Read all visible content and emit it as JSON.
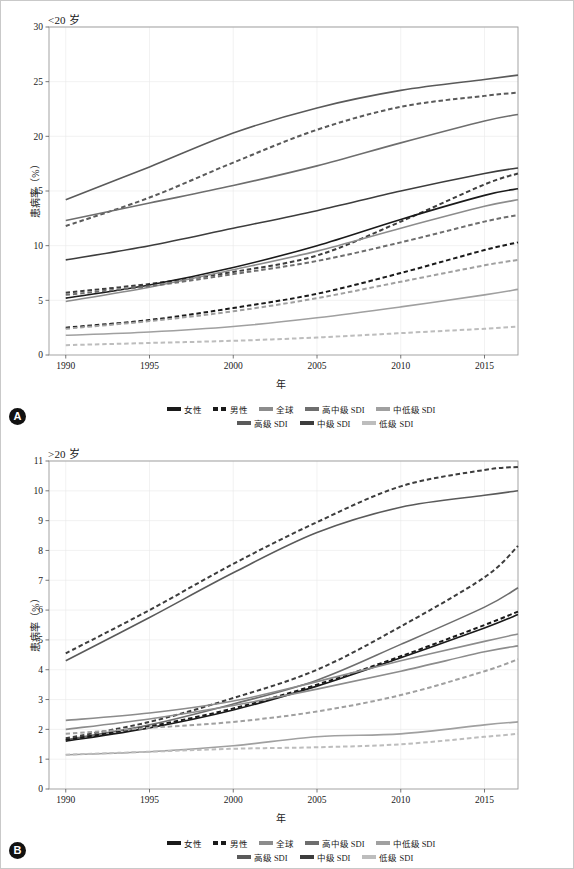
{
  "figure": {
    "background": "#ffffff",
    "border_color": "#c9c9c9"
  },
  "panels": [
    {
      "badge": "A",
      "title": "<20 岁",
      "xlabel": "年",
      "ylabel": "患病率（%）"
    },
    {
      "badge": "B",
      "title": ">20 岁",
      "xlabel": "年",
      "ylabel": "患病率（%）"
    }
  ],
  "legend": {
    "rows": [
      [
        {
          "label": "女性",
          "color": "#1a1a1a",
          "dash": "solid",
          "key": "female"
        },
        {
          "label": "男性",
          "color": "#1a1a1a",
          "dash": "dashed",
          "key": "male"
        },
        {
          "label": "全球",
          "color": "#8c8c8c",
          "dash": "solid",
          "key": "global"
        },
        {
          "label": "高中级 SDI",
          "color": "#6e6e6e",
          "dash": "solid",
          "key": "high-middle-sdi"
        },
        {
          "label": "中低级 SDI",
          "color": "#a0a0a0",
          "dash": "solid",
          "key": "low-middle-sdi"
        }
      ],
      [
        {
          "label": "高级 SDI",
          "color": "#5a5a5a",
          "dash": "solid",
          "key": "high-sdi"
        },
        {
          "label": "中级 SDI",
          "color": "#3d3d3d",
          "dash": "solid",
          "key": "middle-sdi"
        },
        {
          "label": "低级 SDI",
          "color": "#bdbdbd",
          "dash": "solid",
          "key": "low-sdi"
        }
      ]
    ]
  },
  "chart_data": [
    {
      "type": "line",
      "title": "<20 岁",
      "xlabel": "年",
      "ylabel": "患病率（%）",
      "xlim": [
        1989,
        2017
      ],
      "ylim": [
        0,
        30
      ],
      "xticks": [
        1990,
        1995,
        2000,
        2005,
        2010,
        2015
      ],
      "yticks": [
        0,
        5,
        10,
        15,
        20,
        25,
        30
      ],
      "grid": true,
      "legend_position": "below",
      "x": [
        1990,
        1995,
        2000,
        2005,
        2010,
        2015,
        2017
      ],
      "series": [
        {
          "name": "高级 SDI",
          "sex": "女性",
          "dash": "solid",
          "color": "#5a5a5a",
          "values": [
            14.2,
            17.2,
            20.3,
            22.6,
            24.2,
            25.2,
            25.6
          ]
        },
        {
          "name": "高级 SDI",
          "sex": "男性",
          "dash": "dashed",
          "color": "#5a5a5a",
          "values": [
            11.8,
            14.4,
            17.6,
            20.6,
            22.7,
            23.7,
            24.0
          ]
        },
        {
          "name": "高中级 SDI",
          "sex": "女性",
          "dash": "solid",
          "color": "#6e6e6e",
          "values": [
            12.3,
            13.9,
            15.5,
            17.3,
            19.4,
            21.4,
            22.0
          ]
        },
        {
          "name": "中级 SDI",
          "sex": "女性",
          "dash": "solid",
          "color": "#3d3d3d",
          "values": [
            8.7,
            10.0,
            11.6,
            13.2,
            15.0,
            16.6,
            17.1
          ]
        },
        {
          "name": "中级 SDI",
          "sex": "男性",
          "dash": "dashed",
          "color": "#3d3d3d",
          "values": [
            5.7,
            6.5,
            7.6,
            9.1,
            12.2,
            15.6,
            16.6
          ]
        },
        {
          "name": "女性",
          "sex": "女性",
          "dash": "solid",
          "color": "#1a1a1a",
          "values": [
            5.2,
            6.4,
            8.0,
            10.0,
            12.4,
            14.6,
            15.2
          ]
        },
        {
          "name": "全球",
          "sex": "女性",
          "dash": "solid",
          "color": "#8c8c8c",
          "values": [
            4.9,
            6.2,
            7.8,
            9.5,
            11.6,
            13.6,
            14.2
          ]
        },
        {
          "name": "高中级 SDI",
          "sex": "男性",
          "dash": "dashed",
          "color": "#6e6e6e",
          "values": [
            5.5,
            6.3,
            7.4,
            8.6,
            10.3,
            12.2,
            12.8
          ]
        },
        {
          "name": "男性",
          "sex": "男性",
          "dash": "dashed",
          "color": "#1a1a1a",
          "values": [
            2.5,
            3.2,
            4.3,
            5.6,
            7.5,
            9.6,
            10.3
          ]
        },
        {
          "name": "中低级 SDI",
          "sex": "男性",
          "dash": "dashed",
          "color": "#a0a0a0",
          "values": [
            2.4,
            3.1,
            4.0,
            5.2,
            6.7,
            8.2,
            8.7
          ]
        },
        {
          "name": "中低级 SDI",
          "sex": "女性",
          "dash": "solid",
          "color": "#a0a0a0",
          "values": [
            1.8,
            2.1,
            2.6,
            3.4,
            4.4,
            5.5,
            6.0
          ]
        },
        {
          "name": "低级 SDI",
          "sex": "男性",
          "dash": "dashed",
          "color": "#bdbdbd",
          "values": [
            0.9,
            1.1,
            1.3,
            1.6,
            2.0,
            2.4,
            2.6
          ]
        }
      ]
    },
    {
      "type": "line",
      "title": ">20 岁",
      "xlabel": "年",
      "ylabel": "患病率（%）",
      "xlim": [
        1989,
        2017
      ],
      "ylim": [
        0,
        11
      ],
      "xticks": [
        1990,
        1995,
        2000,
        2005,
        2010,
        2015
      ],
      "yticks": [
        0,
        1,
        2,
        3,
        4,
        5,
        6,
        7,
        8,
        9,
        10,
        11
      ],
      "grid": true,
      "legend_position": "below",
      "x": [
        1990,
        1995,
        2000,
        2005,
        2010,
        2015,
        2017
      ],
      "series": [
        {
          "name": "高级 SDI",
          "sex": "男性",
          "dash": "dashed",
          "color": "#3d3d3d",
          "values": [
            4.55,
            6.0,
            7.55,
            8.95,
            10.15,
            10.7,
            10.8
          ]
        },
        {
          "name": "高级 SDI",
          "sex": "女性",
          "dash": "solid",
          "color": "#5a5a5a",
          "values": [
            4.3,
            5.75,
            7.25,
            8.6,
            9.45,
            9.85,
            10.0
          ]
        },
        {
          "name": "中级 SDI",
          "sex": "男性",
          "dash": "dashed",
          "color": "#3d3d3d",
          "values": [
            1.7,
            2.25,
            3.05,
            4.0,
            5.45,
            7.1,
            8.15
          ]
        },
        {
          "name": "中级 SDI",
          "sex": "女性",
          "dash": "solid",
          "color": "#6e6e6e",
          "values": [
            1.65,
            2.15,
            2.85,
            3.65,
            4.85,
            6.1,
            6.75
          ]
        },
        {
          "name": "女性",
          "sex": "女性",
          "dash": "solid",
          "color": "#1a1a1a",
          "values": [
            1.6,
            2.05,
            2.65,
            3.45,
            4.4,
            5.4,
            5.85
          ]
        },
        {
          "name": "男性",
          "sex": "男性",
          "dash": "dashed",
          "color": "#1a1a1a",
          "values": [
            1.65,
            2.1,
            2.7,
            3.5,
            4.45,
            5.5,
            5.95
          ]
        },
        {
          "name": "高中级 SDI",
          "sex": "女性",
          "dash": "solid",
          "color": "#8c8c8c",
          "values": [
            2.3,
            2.55,
            2.95,
            3.6,
            4.3,
            4.95,
            5.2
          ]
        },
        {
          "name": "全球",
          "sex": "女性",
          "dash": "solid",
          "color": "#8c8c8c",
          "values": [
            2.0,
            2.35,
            2.8,
            3.35,
            3.95,
            4.6,
            4.8
          ]
        },
        {
          "name": "中低级 SDI",
          "sex": "男性",
          "dash": "dashed",
          "color": "#a0a0a0",
          "values": [
            1.85,
            2.05,
            2.25,
            2.6,
            3.15,
            3.95,
            4.35
          ]
        },
        {
          "name": "中低级 SDI",
          "sex": "女性",
          "dash": "solid",
          "color": "#a0a0a0",
          "values": [
            1.15,
            1.25,
            1.45,
            1.75,
            1.85,
            2.15,
            2.25
          ]
        },
        {
          "name": "低级 SDI",
          "sex": "男性",
          "dash": "dashed",
          "color": "#bdbdbd",
          "values": [
            1.15,
            1.25,
            1.35,
            1.4,
            1.5,
            1.75,
            1.85
          ]
        }
      ]
    }
  ]
}
